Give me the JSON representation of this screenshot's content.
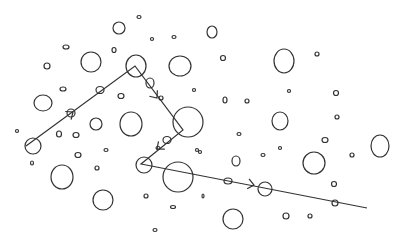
{
  "diagram": {
    "width": 403,
    "height": 242,
    "background": "#ffffff",
    "stroke_color": "#333333",
    "circles": [
      {
        "x": 119,
        "y": 28,
        "rx": 6,
        "ry": 6
      },
      {
        "x": 139,
        "y": 17,
        "rx": 2,
        "ry": 1.5
      },
      {
        "x": 152,
        "y": 39,
        "rx": 1.5,
        "ry": 1.5
      },
      {
        "x": 174,
        "y": 37,
        "rx": 2,
        "ry": 1.5
      },
      {
        "x": 212,
        "y": 32,
        "rx": 5,
        "ry": 6
      },
      {
        "x": 66,
        "y": 47,
        "rx": 3,
        "ry": 2
      },
      {
        "x": 114,
        "y": 50,
        "rx": 2,
        "ry": 2.5
      },
      {
        "x": 91,
        "y": 62,
        "rx": 10,
        "ry": 10
      },
      {
        "x": 136,
        "y": 66,
        "rx": 10,
        "ry": 11
      },
      {
        "x": 180,
        "y": 66,
        "rx": 11,
        "ry": 10
      },
      {
        "x": 47,
        "y": 66,
        "rx": 3,
        "ry": 3
      },
      {
        "x": 223,
        "y": 58,
        "rx": 2.5,
        "ry": 2.5
      },
      {
        "x": 284,
        "y": 61,
        "rx": 10,
        "ry": 12
      },
      {
        "x": 317,
        "y": 54,
        "rx": 2,
        "ry": 2
      },
      {
        "x": 63,
        "y": 89,
        "rx": 3,
        "ry": 2
      },
      {
        "x": 100,
        "y": 90,
        "rx": 4,
        "ry": 3.5
      },
      {
        "x": 150,
        "y": 83,
        "rx": 4,
        "ry": 5
      },
      {
        "x": 161,
        "y": 98,
        "rx": 2,
        "ry": 2
      },
      {
        "x": 194,
        "y": 90,
        "rx": 1.5,
        "ry": 1.5
      },
      {
        "x": 121,
        "y": 96,
        "rx": 3,
        "ry": 2.5
      },
      {
        "x": 43,
        "y": 103,
        "rx": 9,
        "ry": 8
      },
      {
        "x": 71,
        "y": 113,
        "rx": 4,
        "ry": 4
      },
      {
        "x": 96,
        "y": 124,
        "rx": 6,
        "ry": 6
      },
      {
        "x": 131,
        "y": 124,
        "rx": 11,
        "ry": 12
      },
      {
        "x": 188,
        "y": 122,
        "rx": 15,
        "ry": 15
      },
      {
        "x": 225,
        "y": 100,
        "rx": 2,
        "ry": 3
      },
      {
        "x": 247,
        "y": 101,
        "rx": 2,
        "ry": 2
      },
      {
        "x": 289,
        "y": 91,
        "rx": 1.5,
        "ry": 1.5
      },
      {
        "x": 336,
        "y": 93,
        "rx": 2.5,
        "ry": 2.5
      },
      {
        "x": 17,
        "y": 131,
        "rx": 1.5,
        "ry": 1.5
      },
      {
        "x": 59,
        "y": 134,
        "rx": 2.5,
        "ry": 3
      },
      {
        "x": 76,
        "y": 135,
        "rx": 3,
        "ry": 2.5
      },
      {
        "x": 239,
        "y": 134,
        "rx": 2,
        "ry": 1.5
      },
      {
        "x": 280,
        "y": 121,
        "rx": 8,
        "ry": 9
      },
      {
        "x": 337,
        "y": 117,
        "rx": 2,
        "ry": 2
      },
      {
        "x": 325,
        "y": 140,
        "rx": 3,
        "ry": 2.5
      },
      {
        "x": 33,
        "y": 146,
        "rx": 8,
        "ry": 8
      },
      {
        "x": 78,
        "y": 155,
        "rx": 3,
        "ry": 2.5
      },
      {
        "x": 106,
        "y": 150,
        "rx": 2,
        "ry": 1.5
      },
      {
        "x": 97,
        "y": 168,
        "rx": 2,
        "ry": 2
      },
      {
        "x": 32,
        "y": 163,
        "rx": 1.5,
        "ry": 2
      },
      {
        "x": 167,
        "y": 140,
        "rx": 4,
        "ry": 3.5
      },
      {
        "x": 158,
        "y": 148,
        "rx": 2,
        "ry": 1.5
      },
      {
        "x": 200,
        "y": 152,
        "rx": 1.5,
        "ry": 1.5
      },
      {
        "x": 144,
        "y": 165,
        "rx": 8,
        "ry": 8
      },
      {
        "x": 178,
        "y": 177,
        "rx": 15,
        "ry": 15
      },
      {
        "x": 197,
        "y": 150,
        "rx": 1.5,
        "ry": 1.5
      },
      {
        "x": 236,
        "y": 161,
        "rx": 4,
        "ry": 5
      },
      {
        "x": 263,
        "y": 155,
        "rx": 2,
        "ry": 1.5
      },
      {
        "x": 280,
        "y": 148,
        "rx": 1.5,
        "ry": 1.5
      },
      {
        "x": 314,
        "y": 163,
        "rx": 11,
        "ry": 11
      },
      {
        "x": 352,
        "y": 155,
        "rx": 2,
        "ry": 2
      },
      {
        "x": 380,
        "y": 146,
        "rx": 9,
        "ry": 11
      },
      {
        "x": 62,
        "y": 177,
        "rx": 11,
        "ry": 12
      },
      {
        "x": 228,
        "y": 181,
        "rx": 4,
        "ry": 3
      },
      {
        "x": 265,
        "y": 189,
        "rx": 7,
        "ry": 7
      },
      {
        "x": 334,
        "y": 184,
        "rx": 2.5,
        "ry": 2.5
      },
      {
        "x": 146,
        "y": 196,
        "rx": 2,
        "ry": 2
      },
      {
        "x": 173,
        "y": 207,
        "rx": 2.5,
        "ry": 1.5
      },
      {
        "x": 203,
        "y": 196,
        "rx": 1,
        "ry": 2
      },
      {
        "x": 103,
        "y": 200,
        "rx": 10,
        "ry": 10
      },
      {
        "x": 155,
        "y": 230,
        "rx": 2,
        "ry": 1.5
      },
      {
        "x": 233,
        "y": 219,
        "rx": 10,
        "ry": 10
      },
      {
        "x": 335,
        "y": 203,
        "rx": 3,
        "ry": 3
      },
      {
        "x": 286,
        "y": 216,
        "rx": 3,
        "ry": 3
      },
      {
        "x": 310,
        "y": 216,
        "rx": 2,
        "ry": 2
      }
    ],
    "path": {
      "points": [
        [
          26,
          146
        ],
        [
          135,
          66
        ],
        [
          183,
          130
        ],
        [
          141,
          164
        ],
        [
          367,
          208
        ]
      ],
      "arrows": [
        {
          "x": 73,
          "y": 112,
          "angle": -36
        },
        {
          "x": 157,
          "y": 98,
          "angle": 53
        },
        {
          "x": 157,
          "y": 149,
          "angle": 141
        },
        {
          "x": 254,
          "y": 185,
          "angle": 11
        }
      ]
    }
  }
}
